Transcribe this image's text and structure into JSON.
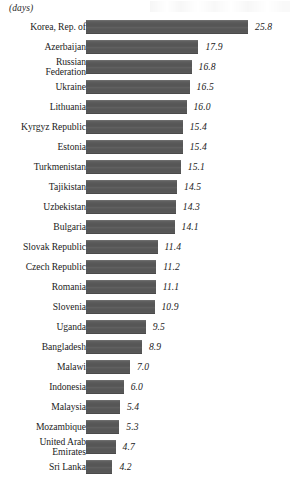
{
  "header": {
    "unit_label": "(days)"
  },
  "chart_data": {
    "type": "bar",
    "orientation": "horizontal",
    "title": "",
    "subtitle": "",
    "xlabel": "",
    "ylabel": "",
    "unit_label": "(days)",
    "grid": false,
    "legend": false,
    "bar_color": "#595959",
    "background_color": "#ffffff",
    "xlim": [
      0,
      25.8
    ],
    "sorted": "descending",
    "categories": [
      "Korea, Rep. of",
      "Azerbaijan",
      "Russian Federation",
      "Ukraine",
      "Lithuania",
      "Kyrgyz Republic",
      "Estonia",
      "Turkmenistan",
      "Tajikistan",
      "Uzbekistan",
      "Bulgaria",
      "Slovak Republic",
      "Czech Republic",
      "Romania",
      "Slovenia",
      "Uganda",
      "Bangladesh",
      "Malawi",
      "Indonesia",
      "Malaysia",
      "Mozambique",
      "United Arab Emirates",
      "Sri Lanka"
    ],
    "values": [
      25.8,
      17.9,
      16.8,
      16.5,
      16.0,
      15.4,
      15.4,
      15.1,
      14.5,
      14.3,
      14.1,
      11.4,
      11.2,
      11.1,
      10.9,
      9.5,
      8.9,
      7.0,
      6.0,
      5.4,
      5.3,
      4.7,
      4.2
    ],
    "value_labels": [
      "25.8",
      "17.9",
      "16.8",
      "16.5",
      "16.0",
      "15.4",
      "15.4",
      "15.1",
      "14.5",
      "14.3",
      "14.1",
      "11.4",
      "11.2",
      "11.1",
      "10.9",
      "9.5",
      "8.9",
      "7.0",
      "6.0",
      "5.4",
      "5.3",
      "4.7",
      "4.2"
    ]
  }
}
